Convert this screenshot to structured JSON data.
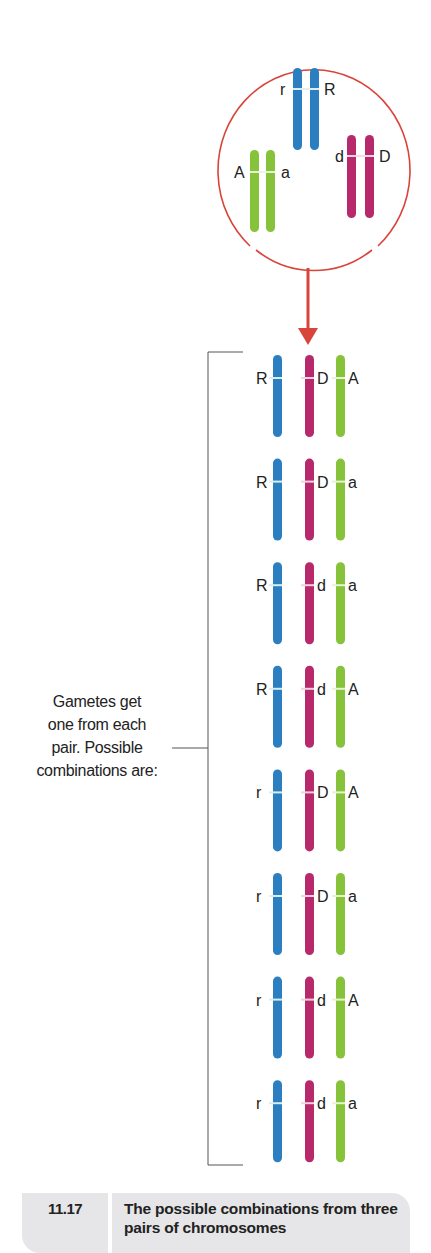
{
  "colors": {
    "blue": "#2b7fc1",
    "magenta": "#b8296b",
    "green": "#86c23a",
    "red": "#d9443a",
    "band": "#d8eef0",
    "caption_bg": "#e6e6e8"
  },
  "cell": {
    "pairs": [
      {
        "name": "R",
        "left_label": "r",
        "right_label": "R",
        "color": "blue"
      },
      {
        "name": "A",
        "left_label": "A",
        "right_label": "a",
        "color": "green"
      },
      {
        "name": "D",
        "left_label": "d",
        "right_label": "D",
        "color": "magenta"
      }
    ]
  },
  "side_label": {
    "lines": [
      "Gametes get",
      "one from each",
      "pair. Possible",
      "combinations are:"
    ]
  },
  "gametes": [
    {
      "r": "R",
      "d": "D",
      "a": "A"
    },
    {
      "r": "R",
      "d": "D",
      "a": "a"
    },
    {
      "r": "R",
      "d": "d",
      "a": "a"
    },
    {
      "r": "R",
      "d": "d",
      "a": "A"
    },
    {
      "r": "r",
      "d": "D",
      "a": "A"
    },
    {
      "r": "r",
      "d": "D",
      "a": "a"
    },
    {
      "r": "r",
      "d": "d",
      "a": "A"
    },
    {
      "r": "r",
      "d": "d",
      "a": "a"
    }
  ],
  "caption": {
    "number": "11.17",
    "text": "The possible combinations from three pairs of chromosomes"
  }
}
